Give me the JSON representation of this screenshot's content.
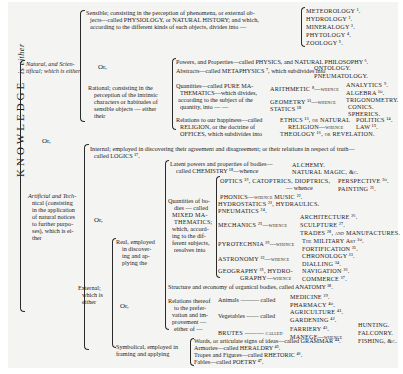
{
  "root": {
    "title": "KNOWLEDGE",
    "suffix": "is either"
  },
  "natural": {
    "label": "Natural, and Scien-tifical; which is either",
    "sensible": {
      "text1": "Sensible; consisting in the perception of phenomena, or external ob-",
      "text2": "jects—called PHYSIOLOGY, or NATURAL HISTORY; and which,",
      "text3": "according to the different kinds of such objects, divides into —",
      "divisions": [
        "METEOROLOGY ¹.",
        "HYDROLOGY ².",
        "MINERALOGY ³.",
        "PHYTOLOGY ⁴.",
        "ZOOLOGY ⁵."
      ]
    },
    "or": "Or,",
    "rational": {
      "text": [
        "Rational; consisting in the",
        "perception of the intrinsic",
        "characters or habitudes of",
        "sensible objects — either",
        "their"
      ],
      "powers": "Powers, and Properties—called PHYSICS, and NATURAL PHILOSOPHY ⁶.",
      "abstracts": "Abstracts—called METAPHYSICS ⁷, which subdivides into",
      "metaphysics": [
        "ONTOLOGY.",
        "PNEUMATOLOGY."
      ],
      "quantities": [
        "Quantities—called PURE MA-",
        "THEMATICS—which divides,",
        "according to the subject of the",
        "quantity, into — —"
      ],
      "arithmetic": "ARITHMETIC ⁸—whence",
      "arith_sub": [
        "ANALYTICS ⁹.",
        "ALGEBRA ¹⁰."
      ],
      "geometry": "GEOMETRY ¹¹—whence",
      "statics": "STATICS ¹⁸",
      "geo_sub": [
        "TRIGONOMETRY.",
        "CONICS.",
        "SPHERICS."
      ],
      "relations": [
        "Relations to our happiness—called",
        "RELIGION, or the doctrine of",
        "OFFICES, which subdivides into"
      ],
      "ethics": "ETHICS ¹³, or NATURAL",
      "religion": "RELIGION—whence",
      "theology": "THEOLOGY ¹⁶, or REVELATION.",
      "ethics_sub": [
        "POLITICS ¹⁴.",
        "LAW ¹⁵."
      ]
    }
  },
  "or_main": "Or,",
  "artificial": {
    "label": [
      "Artificial and Tech-",
      "nical (consisting",
      "in the application",
      "of natural notices",
      "to further purpo-",
      "ses), which is ei-",
      "ther"
    ],
    "internal": [
      "Internal; employed in discovering their agreement and disagreement; or their relations in respect of truth—",
      "called LOGICS ¹⁷."
    ],
    "or": "Or,",
    "external": {
      "label": [
        "External;",
        "which is",
        "either"
      ],
      "real": {
        "label": [
          "Real, employed",
          "in discover-",
          "ing and ap-",
          "plying the"
        ],
        "latent": [
          "Latent powers and properties of bodies—",
          "called CHEMISTRY ¹⁸—whence"
        ],
        "chem_sub": [
          "ALCHEMY.",
          "NATURAL MAGIC, &c."
        ],
        "quantities": [
          "Quantities of bo-",
          "dies — called",
          "MIXED MA-",
          "THEMATICS;",
          "which, accord-",
          "ing to the dif-",
          "ferent subjects,",
          "resolves into"
        ],
        "optics": "OPTICS ¹⁹, CATOPTRICS, DIOPTRICS,",
        "optics_whence": "— whence",
        "optics_sub": [
          "PERSPECTIVE ²⁰.",
          "PAINTING ²¹."
        ],
        "phonics": "PHONICS—whence MUSIC ²².",
        "hydrostatics": "HYDROSTATICS ²³, HYDRAULICS.",
        "pneumatics": "PNEUMATICS ²⁴.",
        "mechanics": "MECHANICS ²⁵—whence",
        "mech_sub": [
          "ARCHITECTURE ²⁶.",
          "SCULPTURE ²⁷.",
          "TRADES ²⁸, and MANUFACTURES."
        ],
        "pyrotechnia": "PYROTECHNIA ²⁹—whence",
        "pyro_sub": [
          "The MILITARY Art ³⁰.",
          "FORTIFICATION ³¹."
        ],
        "astronomy": "ASTRONOMY ³²—whence",
        "astro_sub": [
          "CHRONOLOGY ³³.",
          "DIALLING ³⁴."
        ],
        "geography": [
          "GEOGRAPHY ³⁵, HYDRO-",
          "GRAPHY—whence"
        ],
        "geo_sub": [
          "NAVIGATION ³⁶.",
          "COMMERCE ³⁷."
        ],
        "structure": "Structure and œconomy of organical bodies, called ANATOMY ³⁸.",
        "or": "Or,",
        "relations": [
          "Relations thereof",
          "to the prefer-",
          "vation and im-",
          "provement —",
          "either of —"
        ],
        "animals": "Animals ——— called",
        "animals_sub": [
          "MEDICINE ³⁹.",
          "PHARMACY ⁴⁰."
        ],
        "vegetables": "Vegetables —— called",
        "veg_sub": [
          "AGRICULTURE ⁴¹.",
          "GARDENING ⁴²."
        ],
        "brutes": "BRUTES ——— called",
        "brutes_sub1": "FARRIERY ⁴³.",
        "brutes_sub2": "MANEGE—whence",
        "manege_sub": [
          "HUNTING.",
          "FALCONRY.",
          "FISHING, &c."
        ]
      },
      "symbolical": {
        "label": [
          "Symbolical, employed in",
          "framing and applying"
        ],
        "items": [
          "Words, or articulate signs of ideas—called GRAMMAR ⁴⁴.",
          "Armories—called HERALDRY ⁴⁵.",
          "Tropes and Figures—called RHETORIC ⁴⁶.",
          "Fables—called POETRY ⁴⁷."
        ]
      }
    }
  }
}
